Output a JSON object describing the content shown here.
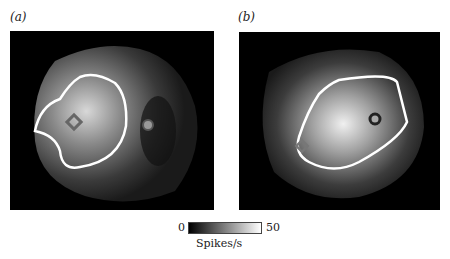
{
  "panels": [
    {
      "label": "(a)",
      "marker_square": "diamond",
      "marker_circle": "filled-dot"
    },
    {
      "label": "(b)",
      "marker_square": "diamond",
      "marker_circle": "ring"
    }
  ],
  "colorbar": {
    "min": "0",
    "max": "50",
    "unit": "Spikes/s"
  }
}
